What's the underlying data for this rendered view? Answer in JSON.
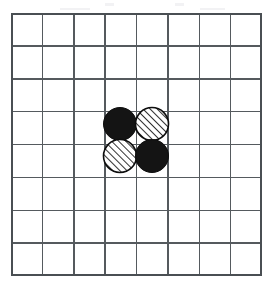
{
  "scene": {
    "title": "Go board position diagram",
    "background_color": "#ffffff",
    "description": "8 by 8 grid of squares with four round stones placed in a 2 by 2 block near the centre"
  },
  "board": {
    "name": "grid-board",
    "columns": 8,
    "rows": 8,
    "left": 11,
    "top": 13,
    "width": 251,
    "height": 263,
    "cell_width": 31.4,
    "cell_height": 32.9,
    "line_color": "#555a5e",
    "border_color": "#4a4f53",
    "line_width": 1.5,
    "border_width": 2
  },
  "stones": {
    "radius": 16.5,
    "black_fill": "#141414",
    "hatch_fill": "#ffffff",
    "hatch_stroke": "#0d0d0d",
    "hatch_angle_deg": 45,
    "hatch_spacing": 5,
    "outline_color": "#0d0d0d",
    "items": [
      {
        "id": "stone-1",
        "label": "black-stone-top-left",
        "fill_style": "solid-black",
        "grid_col": 4,
        "grid_row": 4,
        "cx": 109,
        "cy": 111,
        "r": 16.5
      },
      {
        "id": "stone-2",
        "label": "hatched-stone-top-right",
        "fill_style": "diagonal-hatch",
        "grid_col": 5,
        "grid_row": 4,
        "cx": 141,
        "cy": 111,
        "r": 16.5
      },
      {
        "id": "stone-3",
        "label": "hatched-stone-bottom-left",
        "fill_style": "diagonal-hatch",
        "grid_col": 4,
        "grid_row": 5,
        "cx": 109,
        "cy": 143,
        "r": 16.5
      },
      {
        "id": "stone-4",
        "label": "black-stone-bottom-right",
        "fill_style": "solid-black",
        "grid_col": 5,
        "grid_row": 5,
        "cx": 141,
        "cy": 143,
        "r": 16.5
      }
    ]
  },
  "artifacts": {
    "specks": [
      {
        "left": 105,
        "top": 3,
        "width": 9,
        "height": 3
      },
      {
        "left": 175,
        "top": 3,
        "width": 9,
        "height": 3
      },
      {
        "left": 60,
        "top": 8,
        "width": 30,
        "height": 2
      },
      {
        "left": 200,
        "top": 8,
        "width": 25,
        "height": 2
      }
    ]
  }
}
